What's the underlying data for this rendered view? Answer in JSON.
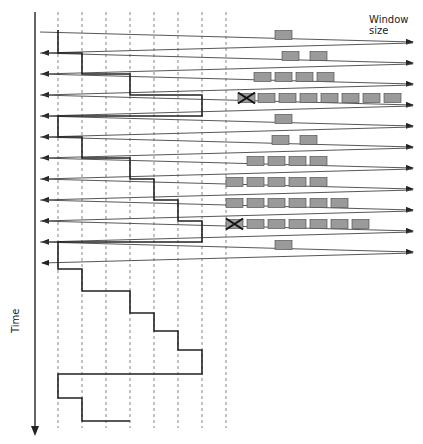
{
  "labels": {
    "window_size": "Window size",
    "time_axis": "Time"
  },
  "colors": {
    "line": "#444444",
    "staircase": "#222222",
    "grid": "#666666",
    "packet_fill": "#9a9a9a",
    "packet_stroke": "#555555",
    "loss_marker": "#111111"
  },
  "layout": {
    "time_axis_x": 35,
    "grid_x": [
      58,
      82,
      106,
      130,
      154,
      178,
      202,
      226
    ],
    "right_end_x": 413,
    "left_end_x": 40
  },
  "rounds": [
    {
      "y_send": 42,
      "y_ack": 53,
      "window": 1,
      "packets_start_x": 275,
      "loss": false
    },
    {
      "y_send": 63,
      "y_ack": 74,
      "window": 2,
      "packets_start_x": 282,
      "gap": true,
      "loss": false
    },
    {
      "y_send": 84,
      "y_ack": 95,
      "window": 4,
      "packets_start_x": 254,
      "loss": false
    },
    {
      "y_send": 105,
      "y_ack": 116,
      "window": 7,
      "packets_start_x": 258,
      "loss": true,
      "loss_x": 238
    },
    {
      "y_send": 126,
      "y_ack": 137,
      "window": 1,
      "packets_start_x": 275,
      "loss": false
    },
    {
      "y_send": 147,
      "y_ack": 158,
      "window": 2,
      "packets_start_x": 272,
      "gap": true,
      "loss": false
    },
    {
      "y_send": 168,
      "y_ack": 179,
      "window": 4,
      "packets_start_x": 247,
      "loss": false
    },
    {
      "y_send": 189,
      "y_ack": 200,
      "window": 5,
      "packets_start_x": 226,
      "loss": false
    },
    {
      "y_send": 210,
      "y_ack": 221,
      "window": 6,
      "packets_start_x": 226,
      "loss": false
    },
    {
      "y_send": 231,
      "y_ack": 242,
      "window": 6,
      "packets_start_x": 247,
      "loss": true,
      "loss_x": 226
    },
    {
      "y_send": 252,
      "y_ack": 263,
      "window": 1,
      "packets_start_x": 275,
      "loss": false
    }
  ],
  "staircase": [
    [
      58,
      30
    ],
    [
      58,
      53
    ],
    [
      82,
      53
    ],
    [
      82,
      74
    ],
    [
      130,
      74
    ],
    [
      130,
      95
    ],
    [
      202,
      95
    ],
    [
      202,
      116
    ],
    [
      58,
      116
    ],
    [
      58,
      137
    ],
    [
      82,
      137
    ],
    [
      82,
      158
    ],
    [
      130,
      158
    ],
    [
      130,
      179
    ],
    [
      154,
      179
    ],
    [
      154,
      200
    ],
    [
      178,
      200
    ],
    [
      178,
      221
    ],
    [
      202,
      221
    ],
    [
      202,
      242
    ],
    [
      58,
      242
    ],
    [
      58,
      269
    ],
    [
      82,
      269
    ],
    [
      82,
      291
    ],
    [
      130,
      291
    ],
    [
      130,
      313
    ],
    [
      154,
      313
    ],
    [
      154,
      331
    ],
    [
      178,
      331
    ],
    [
      178,
      350
    ],
    [
      202,
      350
    ],
    [
      202,
      374
    ],
    [
      58,
      374
    ],
    [
      58,
      398
    ],
    [
      82,
      398
    ],
    [
      82,
      421
    ],
    [
      130,
      421
    ]
  ]
}
